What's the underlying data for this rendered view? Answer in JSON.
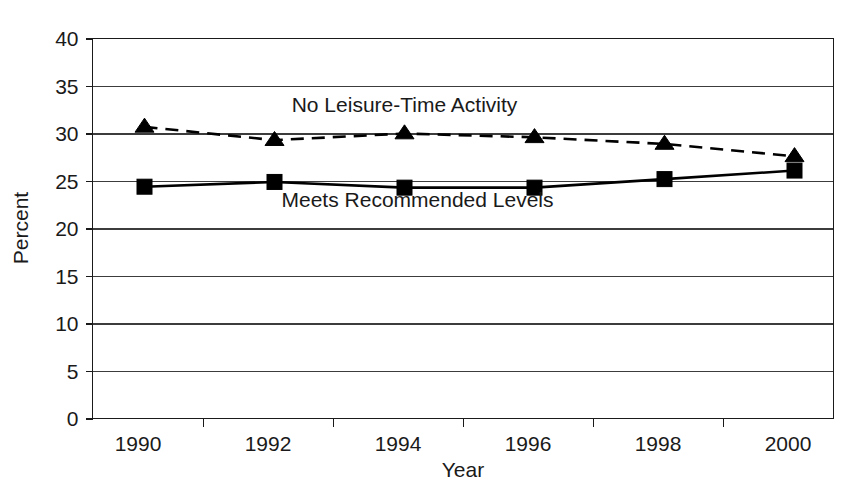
{
  "chart_data": {
    "type": "line",
    "title": "",
    "xlabel": "Year",
    "ylabel": "Percent",
    "categories": [
      "1990",
      "1992",
      "1994",
      "1996",
      "1998",
      "2000"
    ],
    "x": [
      1990,
      1992,
      1994,
      1996,
      1998,
      2000
    ],
    "xlim": [
      1989.2,
      2000.6
    ],
    "ylim": [
      0,
      40
    ],
    "ytick_labels": [
      "0",
      "5",
      "10",
      "15",
      "20",
      "25",
      "30",
      "35",
      "40"
    ],
    "yticks": [
      0,
      5,
      10,
      15,
      20,
      25,
      30,
      35,
      40
    ],
    "grid": true,
    "grid_axis": "y",
    "legend_position": "inline-annotation",
    "series": [
      {
        "name": "No Leisure-Time Activity",
        "marker": "triangle",
        "linestyle": "dashed",
        "color": "#000000",
        "values": [
          30.7,
          29.3,
          30.0,
          29.6,
          28.9,
          27.6
        ]
      },
      {
        "name": "Meets Recommended Levels",
        "marker": "square",
        "linestyle": "solid",
        "color": "#000000",
        "values": [
          24.4,
          24.9,
          24.3,
          24.3,
          25.2,
          26.1
        ]
      }
    ],
    "annotations": [
      {
        "text": "No Leisure-Time Activity",
        "x": 1994.0,
        "y": 32.3
      },
      {
        "text": "Meets Recommended Levels",
        "x": 1994.2,
        "y": 22.3
      }
    ]
  },
  "colors": {
    "background": "#ffffff",
    "ink": "#000000",
    "gridline": "#3c3c3c",
    "text": "#1a1a1a"
  }
}
